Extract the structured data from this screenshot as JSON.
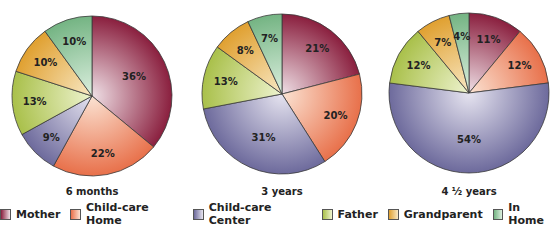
{
  "chart_data": [
    {
      "type": "pie",
      "title": "6 months",
      "labels": [
        "Mother",
        "Child-care Home",
        "Child-care Center",
        "Father",
        "Grandparent",
        "In Home"
      ],
      "values": [
        36,
        22,
        9,
        13,
        10,
        10
      ]
    },
    {
      "type": "pie",
      "title": "3 years",
      "labels": [
        "Mother",
        "Child-care Home",
        "Child-care Center",
        "Father",
        "Grandparent",
        "In Home"
      ],
      "values": [
        21,
        20,
        31,
        13,
        8,
        7
      ]
    },
    {
      "type": "pie",
      "title": "4 ½ years",
      "labels": [
        "Mother",
        "Child-care Home",
        "Child-care Center",
        "Father",
        "Grandparent",
        "In Home"
      ],
      "values": [
        11,
        12,
        54,
        12,
        7,
        4
      ]
    }
  ],
  "legend": {
    "position": "bottom",
    "items": [
      {
        "label": "Mother",
        "color": "#8a1f3e",
        "light": "#efe0e6"
      },
      {
        "label": "Child-care Home",
        "color": "#e8704a",
        "light": "#fbe3d3"
      },
      {
        "label": "Child-care Center",
        "color": "#6d6a9c",
        "light": "#e6e4f0"
      },
      {
        "label": "Father",
        "color": "#a9c04a",
        "light": "#eef3cf"
      },
      {
        "label": "Grandparent",
        "color": "#e0a030",
        "light": "#f8e8c4"
      },
      {
        "label": "In Home",
        "color": "#74b483",
        "light": "#dcefdf"
      }
    ]
  },
  "layout": {
    "pies": [
      {
        "cx": 92,
        "cy": 96,
        "r": 80
      },
      {
        "cx": 282,
        "cy": 94,
        "r": 80
      },
      {
        "cx": 469,
        "cy": 93,
        "r": 80
      }
    ],
    "caption_y": 186
  }
}
